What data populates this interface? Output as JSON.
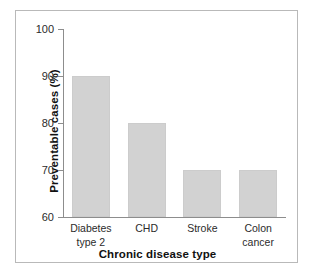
{
  "chart_data": {
    "type": "bar",
    "title": "",
    "categories": [
      "Diabetes type 2",
      "CHD",
      "Stroke",
      "Colon cancer"
    ],
    "category_lines": [
      [
        "Diabetes",
        "type 2"
      ],
      [
        "CHD",
        ""
      ],
      [
        "Stroke",
        ""
      ],
      [
        "Colon",
        "cancer"
      ]
    ],
    "values": [
      90,
      80,
      70,
      70
    ],
    "xlabel": "Chronic disease type",
    "ylabel": "Preventable cases (%)",
    "ylim": [
      60,
      100
    ],
    "yticks": [
      100,
      90,
      80,
      70,
      60
    ],
    "ytick_labels": [
      "100",
      "90",
      "80",
      "70",
      "60"
    ],
    "grid": false,
    "legend": false,
    "bar_color": "#d2d2d2",
    "axis_color": "#8d8d8d",
    "text_color": "#2b2b2b"
  }
}
